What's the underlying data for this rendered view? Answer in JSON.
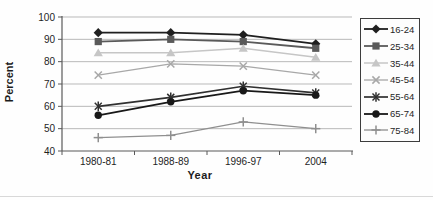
{
  "window": {
    "width": 433,
    "height": 200
  },
  "chart_data": {
    "type": "line",
    "title": "",
    "xlabel": "Year",
    "ylabel": "Percent",
    "ylim": [
      40,
      100
    ],
    "yticks": [
      40,
      50,
      60,
      70,
      80,
      90,
      100
    ],
    "categories": [
      "1980-81",
      "1988-89",
      "1996-97",
      "2004"
    ],
    "grid": true,
    "legend_position": "right",
    "axis_color": "#595959",
    "gridline_color": "#b9b9b9",
    "tick_label_color": "#1f1f1f",
    "series": [
      {
        "name": "16-24",
        "marker": "diamond",
        "color": "#1f1f1f",
        "width": 1.8,
        "values": [
          93,
          93,
          92,
          88
        ]
      },
      {
        "name": "25-34",
        "marker": "square",
        "color": "#5a5a5a",
        "width": 1.8,
        "values": [
          89,
          90,
          89,
          86
        ]
      },
      {
        "name": "35-44",
        "marker": "triangle",
        "color": "#c6c6c6",
        "width": 1.5,
        "values": [
          84,
          84,
          86,
          82
        ]
      },
      {
        "name": "45-54",
        "marker": "x",
        "color": "#a8a8a8",
        "width": 1.3,
        "values": [
          74,
          79,
          78,
          74
        ]
      },
      {
        "name": "55-64",
        "marker": "star",
        "color": "#303030",
        "width": 1.7,
        "values": [
          60,
          64,
          69,
          66
        ]
      },
      {
        "name": "65-74",
        "marker": "circle",
        "color": "#181818",
        "width": 1.8,
        "values": [
          56,
          62,
          67,
          65
        ]
      },
      {
        "name": "75-84",
        "marker": "plus",
        "color": "#8f8f8f",
        "width": 1.3,
        "values": [
          46,
          47,
          53,
          50
        ]
      }
    ]
  }
}
